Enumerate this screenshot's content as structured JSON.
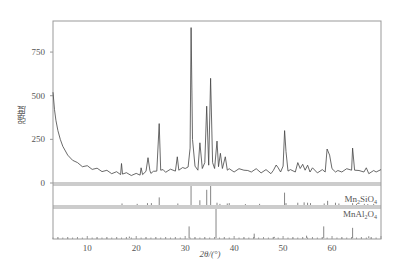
{
  "chart_data": {
    "type": "line",
    "title": "",
    "xlabel": "2θ/(°)",
    "ylabel": "强度",
    "xlim": [
      3,
      70
    ],
    "ylim": [
      0,
      928
    ],
    "xticks": [
      10,
      20,
      30,
      40,
      50,
      60
    ],
    "yticks": [
      0,
      250,
      500,
      750
    ],
    "grid": false,
    "legend": "none",
    "series": [
      {
        "name": "XRD pattern",
        "x": [
          3.0,
          3.3,
          3.6,
          4.0,
          4.5,
          5.0,
          6.0,
          7.0,
          8.0,
          9.0,
          10.0,
          11.0,
          12.0,
          13.0,
          14.0,
          15.0,
          16.0,
          16.8,
          17.0,
          17.2,
          18.0,
          19.0,
          20.0,
          20.8,
          21.0,
          21.3,
          22.0,
          22.4,
          22.8,
          23.0,
          23.5,
          24.2,
          24.7,
          25.0,
          25.5,
          26.0,
          27.0,
          28.0,
          28.4,
          28.7,
          29.5,
          30.0,
          30.6,
          31.0,
          31.2,
          31.5,
          32.0,
          32.6,
          33.0,
          33.5,
          34.0,
          34.4,
          34.8,
          35.2,
          35.6,
          36.0,
          36.5,
          36.8,
          37.2,
          37.6,
          38.2,
          38.6,
          39.0,
          40.0,
          41.0,
          42.0,
          42.8,
          43.5,
          44.5,
          45.5,
          46.5,
          47.5,
          48.0,
          48.6,
          49.0,
          49.5,
          50.0,
          50.3,
          50.6,
          51.0,
          51.5,
          52.5,
          53.0,
          53.5,
          54.0,
          54.5,
          55.0,
          55.5,
          56.0,
          57.0,
          58.0,
          58.6,
          59.0,
          59.5,
          60.0,
          60.7,
          61.2,
          62.0,
          63.0,
          64.0,
          64.2,
          64.6,
          65.5,
          66.5,
          67.0,
          67.5,
          68.5,
          69.0,
          70.0
        ],
        "y": [
          520,
          420,
          360,
          300,
          250,
          210,
          160,
          130,
          110,
          100,
          92,
          85,
          78,
          72,
          66,
          60,
          58,
          55,
          105,
          58,
          52,
          50,
          48,
          52,
          80,
          55,
          60,
          145,
          65,
          62,
          60,
          75,
          340,
          80,
          70,
          68,
          72,
          75,
          150,
          80,
          82,
          90,
          85,
          200,
          890,
          250,
          90,
          80,
          230,
          90,
          110,
          440,
          95,
          600,
          110,
          90,
          240,
          100,
          170,
          90,
          150,
          80,
          75,
          70,
          75,
          80,
          65,
          70,
          75,
          65,
          70,
          60,
          65,
          110,
          80,
          70,
          90,
          300,
          180,
          75,
          70,
          70,
          110,
          90,
          100,
          80,
          95,
          70,
          80,
          65,
          70,
          70,
          195,
          160,
          75,
          70,
          65,
          70,
          75,
          80,
          200,
          80,
          65,
          70,
          80,
          60,
          65,
          70,
          70
        ]
      }
    ],
    "reference_patterns": [
      {
        "name": "Mn₂SiO₄",
        "label_main": "Mn",
        "label_sub1": "2",
        "label_mid": "SiO",
        "label_sub2": "4",
        "peaks_2theta": [
          17.1,
          20.2,
          22.3,
          23.1,
          24.7,
          28.5,
          31.2,
          33.0,
          34.4,
          35.2,
          36.5,
          37.1,
          38.6,
          39.0,
          42.3,
          45.2,
          50.3,
          50.6,
          53.0,
          54.3,
          55.0,
          55.6,
          58.4,
          59.1,
          60.7,
          61.4,
          64.2,
          65.0,
          66.6,
          67.3,
          68.5
        ],
        "peaks_rel_intensity": [
          8,
          6,
          10,
          10,
          40,
          8,
          100,
          25,
          80,
          100,
          12,
          6,
          8,
          10,
          5,
          6,
          65,
          10,
          12,
          14,
          12,
          10,
          8,
          22,
          12,
          8,
          10,
          6,
          6,
          5,
          6
        ]
      },
      {
        "name": "MnAl₂O₄",
        "label_main": "MnAl",
        "label_sub1": "2",
        "label_mid": "O",
        "label_sub2": "4",
        "peaks_2theta": [
          18.6,
          30.8,
          36.3,
          44.1,
          48.2,
          54.8,
          58.3,
          64.2,
          67.5
        ],
        "peaks_rel_intensity": [
          5,
          40,
          100,
          15,
          4,
          8,
          40,
          35,
          6
        ]
      }
    ]
  }
}
